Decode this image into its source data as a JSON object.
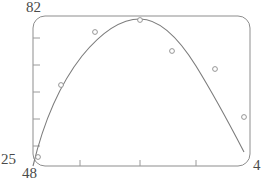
{
  "chart_data": {
    "type": "scatter",
    "title": "",
    "xlabel": "",
    "ylabel": "",
    "xlim": [
      48,
      4
    ],
    "ylim": [
      25,
      82
    ],
    "axis_labels": {
      "y_max": "82",
      "y_min": "25",
      "x_min": "48",
      "x_max": "4"
    },
    "grid": false,
    "legend": null,
    "frame": "rounded-rectangle",
    "x_ticks_px": [
      80,
      140,
      196
    ],
    "y_ticks_px": [
      38,
      65,
      92,
      119,
      146
    ],
    "points": [
      {
        "px": 38,
        "py": 157
      },
      {
        "px": 61,
        "py": 85
      },
      {
        "px": 95,
        "py": 32
      },
      {
        "px": 140,
        "py": 20
      },
      {
        "px": 172,
        "py": 51
      },
      {
        "px": 215,
        "py": 69
      },
      {
        "px": 244,
        "py": 117
      }
    ],
    "fit_curve": {
      "kind": "parabola",
      "path": "M 33,166 C 44,120 60,84 82,56 C 104,29 124,19 140,19 C 158,19 176,34 196,66 C 212,92 230,125 244,152"
    },
    "colors": {
      "frame": "#8d8d8d",
      "curve": "#7c7c7c",
      "point_stroke": "#8a8a8a",
      "point_fill": "#ffffff",
      "label_text": "#4a4a4a",
      "background": "#ffffff"
    }
  }
}
